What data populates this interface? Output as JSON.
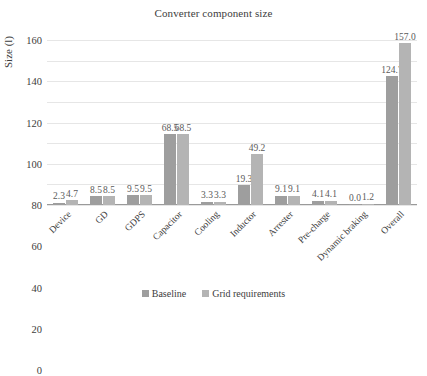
{
  "chart_data": {
    "type": "bar",
    "title": "Converter component size",
    "xlabel": "",
    "ylabel": "Size (l)",
    "ylim": [
      0,
      160
    ],
    "yticks": [
      0,
      20,
      40,
      60,
      80,
      100,
      120,
      140,
      160
    ],
    "grid": true,
    "legend_position": "bottom",
    "categories": [
      "Device",
      "GD",
      "GDPS",
      "Capacitor",
      "Cooling",
      "Inductor",
      "Arrester",
      "Pre-charge",
      "Dynamic braking",
      "Overall"
    ],
    "series": [
      {
        "name": "Baseline",
        "color": "#9e9e9e",
        "values": [
          2.3,
          8.5,
          9.5,
          68.5,
          3.3,
          19.3,
          9.1,
          4.1,
          0.0,
          124.7
        ],
        "labels": [
          "2.3",
          "8.5",
          "9.5",
          "68.5",
          "3.3",
          "19.3",
          "9.1",
          "4.1",
          "0.0",
          "124.7"
        ]
      },
      {
        "name": "Grid requirements",
        "color": "#b4b4b4",
        "values": [
          4.7,
          8.5,
          9.5,
          68.5,
          3.3,
          49.2,
          9.1,
          4.1,
          1.2,
          157.0
        ],
        "labels": [
          "4.7",
          "8.5",
          "9.5",
          "68.5",
          "3.3",
          "49.2",
          "9.1",
          "4.1",
          "1.2",
          "157.0"
        ]
      }
    ]
  }
}
